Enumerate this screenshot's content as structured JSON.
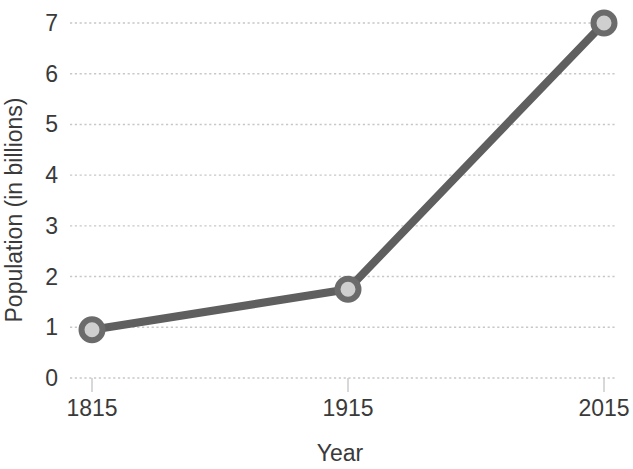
{
  "chart_data": {
    "type": "line",
    "title": "",
    "xlabel": "Year",
    "ylabel": "Population (in billions)",
    "x": [
      1815,
      1915,
      2015
    ],
    "values": [
      0.95,
      1.75,
      7.0
    ],
    "categories": [
      "1815",
      "1915",
      "2015"
    ],
    "xticklabels": [
      "1815",
      "1915",
      "2015"
    ],
    "yticklabels": [
      "0",
      "1",
      "2",
      "3",
      "4",
      "5",
      "6",
      "7"
    ],
    "ytickvalues": [
      0,
      1,
      2,
      3,
      4,
      5,
      6,
      7
    ],
    "xlim": [
      1815,
      2015
    ],
    "ylim": [
      0,
      7
    ],
    "grid": "horizontal-dotted",
    "legend": "none",
    "series": [
      {
        "name": "Population",
        "values": [
          0.95,
          1.75,
          7.0
        ]
      }
    ],
    "style": {
      "line_color": "#5f5f5f",
      "marker_edge_color": "#6b6b6b",
      "marker_face_color": "#cfcfcf",
      "grid_color": "#c8c8c8",
      "text_color": "#3a3a3a",
      "background": "#ffffff"
    }
  }
}
